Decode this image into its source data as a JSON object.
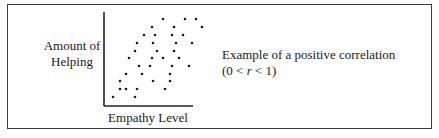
{
  "chart_data": {
    "type": "scatter",
    "title": "",
    "xlabel": "Empathy Level",
    "ylabel": "Amount of Helping",
    "grid": false,
    "ticks": false,
    "annotation": "Example of a positive correlation (0 < r < 1)",
    "points_px": [
      [
        163,
        19
      ],
      [
        185,
        19
      ],
      [
        196,
        19
      ],
      [
        152,
        27
      ],
      [
        174,
        27
      ],
      [
        202,
        27
      ],
      [
        144,
        35
      ],
      [
        155,
        35
      ],
      [
        172,
        35
      ],
      [
        183,
        35
      ],
      [
        137,
        43
      ],
      [
        153,
        43
      ],
      [
        176,
        43
      ],
      [
        192,
        43
      ],
      [
        135,
        51
      ],
      [
        157,
        51
      ],
      [
        174,
        51
      ],
      [
        129,
        58
      ],
      [
        152,
        58
      ],
      [
        163,
        58
      ],
      [
        179,
        58
      ],
      [
        139,
        66
      ],
      [
        150,
        66
      ],
      [
        172,
        66
      ],
      [
        189,
        66
      ],
      [
        126,
        74
      ],
      [
        142,
        74
      ],
      [
        170,
        74
      ],
      [
        120,
        81
      ],
      [
        153,
        81
      ],
      [
        170,
        81
      ],
      [
        120,
        89
      ],
      [
        126,
        89
      ],
      [
        137,
        89
      ],
      [
        165,
        89
      ],
      [
        113,
        97
      ],
      [
        135,
        97
      ]
    ],
    "axes_px": {
      "origin": [
        104,
        106
      ],
      "x_end": 193,
      "y_end": 12
    }
  },
  "labels": {
    "ylabel_line1": "Amount of",
    "ylabel_line2": "Helping",
    "xlabel": "Empathy Level",
    "desc_line1": "Example of a positive correlation",
    "desc_line2_prefix": "(0 < ",
    "desc_line2_var": "r",
    "desc_line2_suffix": " < 1)"
  },
  "colors": {
    "ink": "#1a1a1a",
    "frame": "#3a3a3a",
    "background": "#ffffff"
  }
}
